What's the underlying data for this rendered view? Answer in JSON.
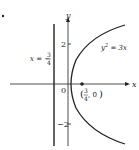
{
  "diagram": {
    "marker": "•",
    "axis_labels": {
      "x": "x",
      "y": "y"
    },
    "origin_label": "0",
    "ticks": {
      "pos": "2",
      "neg": "−2"
    },
    "curve_label": {
      "base": "y",
      "exp": "2",
      "rest": " = 3x"
    },
    "directrix_label": {
      "prefix": "x = −",
      "num": "3",
      "den": "4"
    },
    "focus_label": {
      "num": "3",
      "den": "4",
      "rest": ", 0"
    },
    "colors": {
      "line": "#222222",
      "background": "#ffffff"
    }
  }
}
